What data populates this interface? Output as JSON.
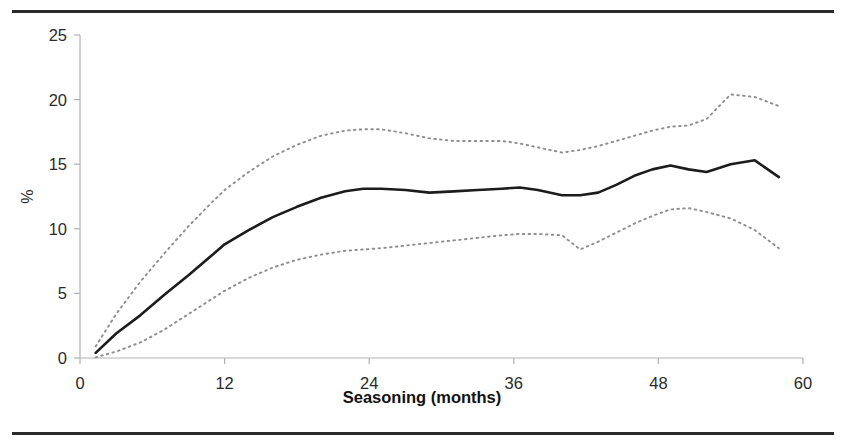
{
  "figure": {
    "name": "seasoning-percentage-chart",
    "top_rule_color": "#2b2b2b",
    "bottom_rule_color": "#2b2b2b"
  },
  "chart_data": {
    "type": "line",
    "title": "",
    "subtitle": "",
    "xlabel": "Seasoning (months)",
    "ylabel": "%",
    "xlim": [
      0,
      60
    ],
    "ylim": [
      0,
      25
    ],
    "xticks": [
      0,
      12,
      24,
      36,
      48,
      60
    ],
    "xticklabels": [
      "0",
      "12",
      "24",
      "36",
      "48",
      "60"
    ],
    "yticks": [
      0,
      5,
      10,
      15,
      20,
      25
    ],
    "yticklabels": [
      "0",
      "5",
      "10",
      "15",
      "20",
      "25"
    ],
    "grid": false,
    "legend": "none",
    "colors": {
      "estimate": "#1c1c1c",
      "confidence_band": "#8e8e8e"
    },
    "x": [
      1.3,
      3,
      5,
      7,
      9,
      11,
      12,
      14,
      16,
      18,
      20,
      22,
      23.5,
      25,
      27,
      29,
      31,
      33,
      35,
      36.5,
      38,
      40,
      41.5,
      43,
      44.5,
      46,
      47.5,
      49,
      50.5,
      52,
      54,
      56,
      58
    ],
    "series": [
      {
        "name": "Estimate",
        "style": "solid",
        "values": [
          0.4,
          1.9,
          3.3,
          4.9,
          6.4,
          8.0,
          8.8,
          9.9,
          10.9,
          11.7,
          12.4,
          12.9,
          13.1,
          13.1,
          13.0,
          12.8,
          12.9,
          13.0,
          13.1,
          13.2,
          13.0,
          12.6,
          12.6,
          12.8,
          13.4,
          14.1,
          14.6,
          14.9,
          14.6,
          14.4,
          15.0,
          15.3,
          14.0
        ]
      },
      {
        "name": "Upper confidence limit",
        "style": "dotted",
        "values": [
          0.9,
          3.4,
          5.9,
          8.1,
          10.2,
          12.1,
          13.0,
          14.4,
          15.6,
          16.5,
          17.2,
          17.6,
          17.7,
          17.7,
          17.4,
          17.0,
          16.8,
          16.8,
          16.8,
          16.6,
          16.3,
          15.9,
          16.1,
          16.4,
          16.8,
          17.2,
          17.6,
          17.9,
          18.0,
          18.5,
          20.4,
          20.2,
          19.5
        ]
      },
      {
        "name": "Lower confidence limit",
        "style": "dotted",
        "values": [
          0.05,
          0.5,
          1.2,
          2.2,
          3.4,
          4.6,
          5.2,
          6.2,
          7.0,
          7.6,
          8.0,
          8.3,
          8.4,
          8.5,
          8.7,
          8.9,
          9.1,
          9.3,
          9.5,
          9.6,
          9.6,
          9.5,
          8.4,
          9.0,
          9.7,
          10.4,
          11.0,
          11.5,
          11.6,
          11.3,
          10.8,
          9.9,
          8.5
        ]
      }
    ]
  }
}
